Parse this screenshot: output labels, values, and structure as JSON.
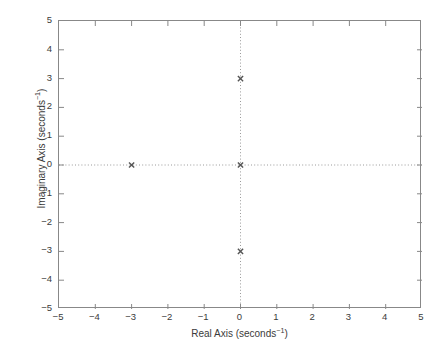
{
  "chart_data": {
    "type": "scatter",
    "title": "",
    "subtitle": "",
    "xlabel_text": "Real Axis (seconds",
    "xlabel_exponent": "−1",
    "xlabel_tail": ")",
    "xlabel_full": "Real Axis (seconds⁻¹)",
    "ylabel_text": "Imaginary Axis (seconds",
    "ylabel_exponent": "−1",
    "ylabel_tail": ")",
    "ylabel_full": "Imaginary Axis (seconds⁻¹)",
    "xlim": [
      -5,
      5
    ],
    "ylim": [
      -5,
      5
    ],
    "xticks": [
      -5,
      -4,
      -3,
      -2,
      -1,
      0,
      1,
      2,
      3,
      4,
      5
    ],
    "yticks": [
      -5,
      -4,
      -3,
      -2,
      -1,
      0,
      1,
      2,
      3,
      4,
      5
    ],
    "xtick_labels": [
      "−5",
      "−4",
      "−3",
      "−2",
      "−1",
      "0",
      "1",
      "2",
      "3",
      "4",
      "5"
    ],
    "ytick_labels": [
      "−5",
      "−4",
      "−3",
      "−2",
      "−1",
      "0",
      "1",
      "2",
      "3",
      "4",
      "5"
    ],
    "grid": false,
    "zero_lines": true,
    "zero_line_style": "dotted",
    "legend": null,
    "legend_position": "none",
    "series": [
      {
        "name": "poles",
        "marker": "x",
        "color": "#555555",
        "points": [
          {
            "x": -3,
            "y": 0
          },
          {
            "x": 0,
            "y": 0
          },
          {
            "x": 0,
            "y": 3
          },
          {
            "x": 0,
            "y": -3
          }
        ]
      }
    ],
    "colors": {
      "axis": "#888888",
      "tick_text": "#3b3b3b",
      "marker": "#555555",
      "zero_line": "#9a9a9a",
      "background": "#ffffff"
    }
  }
}
